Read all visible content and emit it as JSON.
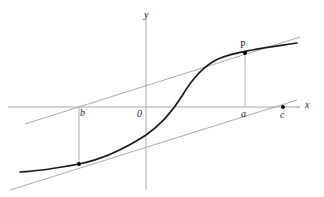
{
  "figure": {
    "background_color": "#ffffff",
    "width": 324,
    "height": 197
  },
  "axes": {
    "x_axis": {
      "label": "x",
      "label_style": "italic",
      "color": "#a9a9a9",
      "y_pixel": 107,
      "x_start": 8,
      "x_end": 300
    },
    "y_axis": {
      "label": "y",
      "label_style": "italic",
      "color": "#a9a9a9",
      "x_pixel": 146,
      "y_start": 14,
      "y_end": 190
    },
    "origin_label": "0"
  },
  "labels": {
    "origin": "0",
    "x_axis": "x",
    "y_axis": "y",
    "point_b": "b",
    "point_a": "a",
    "point_c": "c",
    "point_P": "P"
  },
  "marked_points": [
    {
      "name": "point-b-on-curve",
      "label": "b",
      "label_position": "above-right-of-axis-tick",
      "x_pixel": 79,
      "axis_y_pixel": 107,
      "curve_y_pixel": 164,
      "has_drop_line": true
    },
    {
      "name": "point-P-on-curve",
      "label": "P",
      "label_position": "above-point",
      "x_pixel": 245,
      "axis_y_pixel": 107,
      "curve_y_pixel": 53,
      "has_drop_line": true
    },
    {
      "name": "point-c-on-x-axis",
      "label": "c",
      "label_position": "below-point",
      "x_pixel": 283,
      "axis_y_pixel": 107,
      "has_drop_line": false
    }
  ],
  "curve": {
    "name": "main-curve",
    "description": "S-shaped (sigmoid) increasing curve",
    "color": "#1a1a1a",
    "stroke_width": 1.7,
    "path": "M 20,172 C 40,171 58,168 79,164 C 104,159 126,148 146,135 C 162,124 172,112 182,96 C 192,79 203,66 218,59 C 232,53 242,52 252,50 C 268,47 284,45 297,43"
  },
  "secant_lines": [
    {
      "name": "upper-secant-line",
      "description": "line through point at b and point P",
      "color": "#a0a0a0",
      "x1": 25,
      "y1": 124,
      "x2": 300,
      "y2": 37
    },
    {
      "name": "lower-secant-line",
      "description": "parallel line crossing x-axis at c, tangent near b",
      "color": "#a0a0a0",
      "x1": 10,
      "y1": 190,
      "x2": 297,
      "y2": 100
    }
  ],
  "drop_lines": [
    {
      "name": "drop-line-b",
      "x": 79,
      "y_top": 107,
      "y_bottom": 164
    },
    {
      "name": "drop-line-a",
      "x": 245,
      "y_top": 53,
      "y_bottom": 107
    }
  ]
}
